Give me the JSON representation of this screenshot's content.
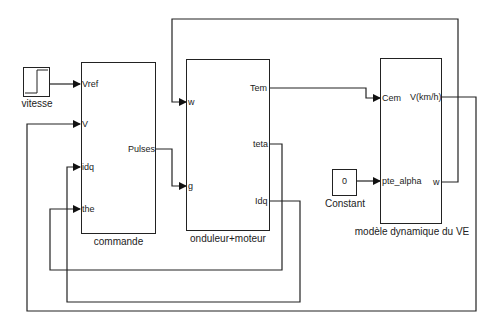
{
  "blocks": {
    "vitesse": {
      "name": "vitesse",
      "type": "step"
    },
    "commande": {
      "name": "commande",
      "inputs": [
        "Vref",
        "V",
        "idq",
        "the"
      ],
      "outputs": [
        "Pulses"
      ]
    },
    "onduleur": {
      "name": "onduleur+moteur",
      "inputs": [
        "w",
        "g"
      ],
      "outputs": [
        "Tem",
        "teta",
        "Idq"
      ]
    },
    "modele": {
      "name": "modèle dynamique du VE",
      "inputs": [
        "Cem",
        "pte_alpha"
      ],
      "outputs": [
        "V(km/h)",
        "w"
      ]
    },
    "constant": {
      "name": "Constant",
      "value": "0"
    }
  },
  "connections": [
    {
      "from": "vitesse",
      "to": "commande.Vref"
    },
    {
      "from": "commande.Pulses",
      "to": "onduleur.g"
    },
    {
      "from": "onduleur.Tem",
      "to": "modele.Cem"
    },
    {
      "from": "constant",
      "to": "modele.pte_alpha"
    },
    {
      "from": "modele.w",
      "to": "onduleur.w"
    },
    {
      "from": "modele.V(km/h)",
      "to": "commande.V"
    },
    {
      "from": "onduleur.teta",
      "to": "commande.the"
    },
    {
      "from": "onduleur.Idq",
      "to": "commande.idq"
    }
  ],
  "colors": {
    "line": "#222222",
    "background": "#ffffff"
  }
}
